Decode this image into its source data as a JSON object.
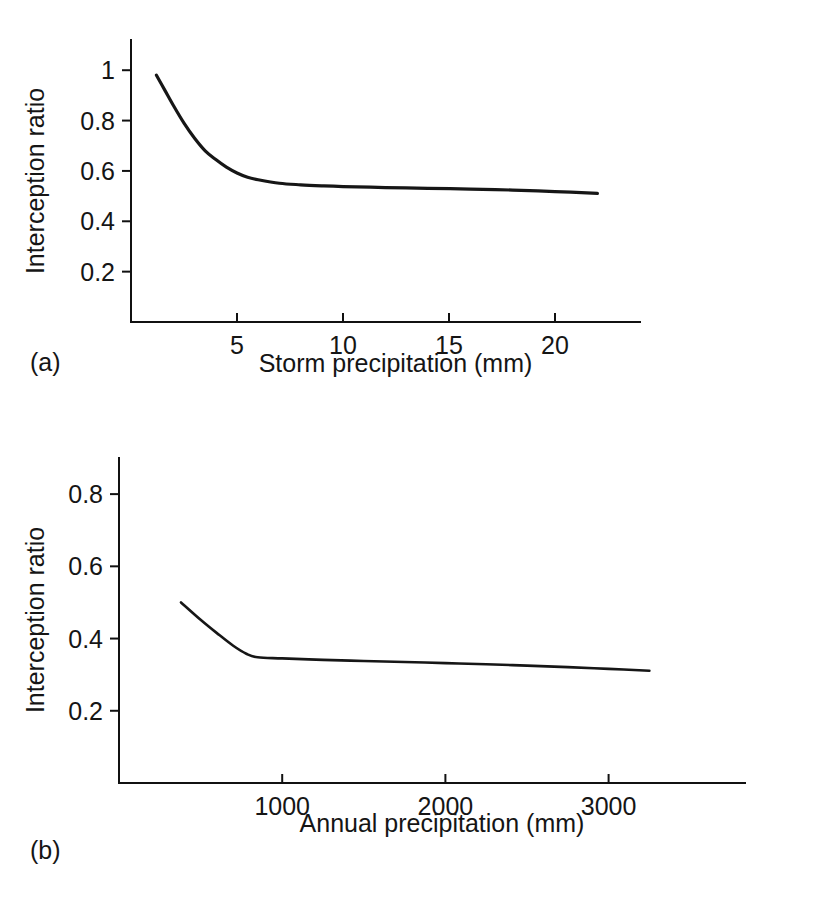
{
  "figure": {
    "background_color": "#ffffff",
    "line_color": "#161616",
    "axis_color": "#111111",
    "panels": [
      {
        "letter": "(a)"
      },
      {
        "letter": "(b)"
      }
    ]
  },
  "chart_data": [
    {
      "type": "line",
      "panel_label": "(a)",
      "title": "",
      "xlabel": "Storm precipitation (mm)",
      "ylabel": "Interception ratio",
      "xlim": [
        0,
        24
      ],
      "ylim": [
        0,
        1.12
      ],
      "grid": false,
      "legend": "none",
      "x_ticks": [
        5,
        10,
        15,
        20
      ],
      "x_tick_labels": [
        "5",
        "10",
        "15",
        "20"
      ],
      "y_ticks": [
        0.2,
        0.4,
        0.6,
        0.8,
        1.0
      ],
      "y_tick_labels": [
        "0.2",
        "0.4",
        "0.6",
        "0.8",
        "1"
      ],
      "series": [
        {
          "name": "Interception ratio vs storm precipitation",
          "x": [
            1.2,
            1.6,
            2.0,
            2.5,
            3.0,
            3.5,
            4.0,
            4.5,
            5.0,
            5.5,
            6.0,
            7.0,
            8.0,
            9.0,
            10.0,
            12.0,
            14.0,
            16.0,
            18.0,
            20.0,
            22.0
          ],
          "y": [
            0.98,
            0.92,
            0.86,
            0.79,
            0.73,
            0.68,
            0.645,
            0.615,
            0.592,
            0.575,
            0.565,
            0.551,
            0.545,
            0.541,
            0.538,
            0.534,
            0.531,
            0.528,
            0.524,
            0.518,
            0.511
          ]
        }
      ]
    },
    {
      "type": "line",
      "panel_label": "(b)",
      "title": "",
      "xlabel": "Annual precipitation (mm)",
      "ylabel": "Interception ratio",
      "xlim": [
        0,
        3850
      ],
      "ylim": [
        0,
        0.9
      ],
      "grid": false,
      "legend": "none",
      "x_ticks": [
        1000,
        2000,
        3000
      ],
      "x_tick_labels": [
        "1000",
        "2000",
        "3000"
      ],
      "y_ticks": [
        0.2,
        0.4,
        0.6,
        0.8
      ],
      "y_tick_labels": [
        "0.2",
        "0.4",
        "0.6",
        "0.8"
      ],
      "series": [
        {
          "name": "Interception ratio vs annual precipitation",
          "x": [
            380,
            500,
            600,
            700,
            780,
            850,
            1000,
            1250,
            1500,
            1750,
            2000,
            2250,
            2500,
            2750,
            3000,
            3250
          ],
          "y": [
            0.5,
            0.452,
            0.415,
            0.38,
            0.358,
            0.348,
            0.345,
            0.341,
            0.338,
            0.335,
            0.332,
            0.329,
            0.325,
            0.321,
            0.316,
            0.311
          ]
        }
      ]
    }
  ]
}
